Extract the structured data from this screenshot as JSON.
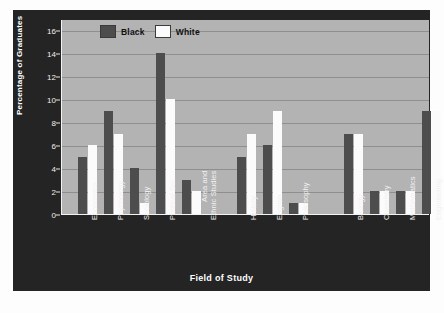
{
  "chart_data": {
    "type": "bar",
    "title": "",
    "xlabel": "Field of Study",
    "ylabel": "Percentage of Graduates",
    "ylim": [
      0,
      17
    ],
    "yticks": [
      0,
      2,
      4,
      6,
      8,
      10,
      12,
      14,
      16
    ],
    "grid": true,
    "legend_position": "top-left",
    "categories": [
      "Economics",
      "Psychology",
      "Sociology",
      "Political Sci.",
      "Area and\nEthnic Studies",
      "History",
      "English",
      "Philosophy",
      "Biology",
      "Chemistry",
      "Mathematics",
      "Engineering"
    ],
    "series": [
      {
        "name": "Black",
        "color": "#4d4d4d",
        "values": [
          5,
          9,
          4,
          14,
          3,
          5,
          6,
          1,
          7,
          2,
          2,
          9
        ]
      },
      {
        "name": "White",
        "color": "#fbfbfb",
        "values": [
          6,
          7,
          1,
          10,
          2,
          7,
          9,
          1,
          7,
          2,
          2,
          9
        ]
      }
    ]
  },
  "legend": {
    "items": [
      {
        "label": "Black",
        "color": "#4d4d4d"
      },
      {
        "label": "White",
        "color": "#fbfbfb"
      }
    ]
  },
  "axes": {
    "y_title": "Percentage of Graduates",
    "x_title": "Field of Study",
    "y_tick_labels": [
      "16",
      "14",
      "12",
      "10",
      "8",
      "6",
      "4",
      "2",
      "0"
    ]
  },
  "colors": {
    "panel_background": "#242424",
    "plot_background": "#b3b3b3",
    "gridline": "#8f8f8f",
    "axis_text": "#f2f2f2",
    "bar_black": "#4d4d4d",
    "bar_white": "#fbfbfb"
  }
}
